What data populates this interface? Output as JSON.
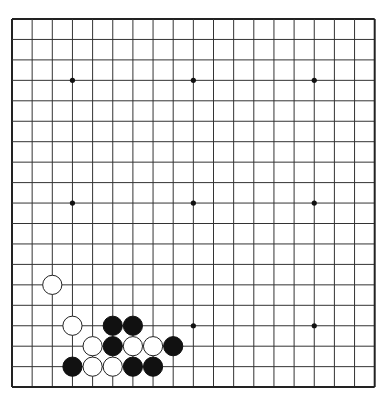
{
  "board": {
    "size": 19,
    "origin_x": 12,
    "origin_y": 19,
    "spacing_x": 20.15,
    "spacing_y": 20.45,
    "line_color": "#333333",
    "border_color": "#222222",
    "background": "#ffffff",
    "star_points": [
      [
        3,
        3
      ],
      [
        9,
        3
      ],
      [
        15,
        3
      ],
      [
        3,
        9
      ],
      [
        9,
        9
      ],
      [
        15,
        9
      ],
      [
        3,
        15
      ],
      [
        9,
        15
      ],
      [
        15,
        15
      ]
    ]
  },
  "stones": [
    {
      "color": "white",
      "col": 2,
      "row": 13
    },
    {
      "color": "white",
      "col": 3,
      "row": 15
    },
    {
      "color": "black",
      "col": 5,
      "row": 15
    },
    {
      "color": "black",
      "col": 6,
      "row": 15
    },
    {
      "color": "white",
      "col": 4,
      "row": 16
    },
    {
      "color": "black",
      "col": 5,
      "row": 16
    },
    {
      "color": "white",
      "col": 6,
      "row": 16
    },
    {
      "color": "white",
      "col": 7,
      "row": 16
    },
    {
      "color": "black",
      "col": 8,
      "row": 16
    },
    {
      "color": "black",
      "col": 3,
      "row": 17
    },
    {
      "color": "white",
      "col": 4,
      "row": 17
    },
    {
      "color": "white",
      "col": 5,
      "row": 17
    },
    {
      "color": "black",
      "col": 6,
      "row": 17
    },
    {
      "color": "black",
      "col": 7,
      "row": 17
    }
  ]
}
